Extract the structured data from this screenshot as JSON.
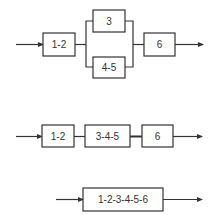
{
  "diagram": {
    "type": "reliability block diagram reduction",
    "colors": {
      "stroke": "#333333",
      "background": "#ffffff",
      "text": "#333333"
    },
    "row1": {
      "blocks": [
        {
          "id": "b12",
          "label": "1-2"
        },
        {
          "id": "b3",
          "label": "3"
        },
        {
          "id": "b45",
          "label": "4-5"
        },
        {
          "id": "b6",
          "label": "6"
        }
      ],
      "structure": "1-2 in series with (3 parallel 4-5) in series with 6"
    },
    "row2": {
      "blocks": [
        {
          "id": "b12",
          "label": "1-2"
        },
        {
          "id": "b345",
          "label": "3-4-5"
        },
        {
          "id": "b6",
          "label": "6"
        }
      ],
      "structure": "series"
    },
    "row3": {
      "blocks": [
        {
          "id": "b123456",
          "label": "1-2-3-4-5-6"
        }
      ],
      "structure": "single equivalent block"
    }
  }
}
